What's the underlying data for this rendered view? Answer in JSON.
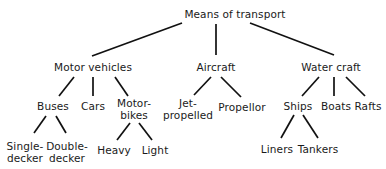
{
  "diagram": {
    "type": "tree",
    "root": {
      "label": "Means of transport",
      "children": [
        {
          "label": "Motor vehicles",
          "children": [
            {
              "label": "Buses",
              "children": [
                {
                  "label": "Single-decker"
                },
                {
                  "label": "Double-decker"
                }
              ]
            },
            {
              "label": "Cars"
            },
            {
              "label": "Motor-bikes",
              "children": [
                {
                  "label": "Heavy"
                },
                {
                  "label": "Light"
                }
              ]
            }
          ]
        },
        {
          "label": "Aircraft",
          "children": [
            {
              "label": "Jet-propelled"
            },
            {
              "label": "Propellor"
            }
          ]
        },
        {
          "label": "Water craft",
          "children": [
            {
              "label": "Ships",
              "children": [
                {
                  "label": "Liners"
                },
                {
                  "label": "Tankers"
                }
              ]
            },
            {
              "label": "Boats"
            },
            {
              "label": "Rafts"
            }
          ]
        }
      ]
    }
  },
  "nodes": {
    "root": "Means of transport",
    "motor_vehicles": "Motor vehicles",
    "aircraft": "Aircraft",
    "water_craft": "Water craft",
    "buses": "Buses",
    "cars": "Cars",
    "motorbikes_line1": "Motor-",
    "motorbikes_line2": "bikes",
    "jet_line1": "Jet-",
    "jet_line2": "propelled",
    "propellor": "Propellor",
    "ships": "Ships",
    "boats": "Boats",
    "rafts": "Rafts",
    "single_line1": "Single-",
    "single_line2": "decker",
    "double_line1": "Double-",
    "double_line2": "decker",
    "heavy": "Heavy",
    "light": "Light",
    "liners": "Liners",
    "tankers": "Tankers"
  },
  "colors": {
    "background": "#ffffff",
    "text": "#1a1a1a",
    "line": "#111111"
  }
}
